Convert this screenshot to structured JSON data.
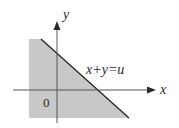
{
  "diagram": {
    "type": "region-plot",
    "axes": {
      "x_label": "x",
      "y_label": "y",
      "origin_label": "0"
    },
    "line_label": "x+y=u",
    "shaded_region": "x + y ≤ u",
    "colors": {
      "shade": "#c8c8c8",
      "line": "#2a2a2a",
      "axis": "#555555",
      "background": "#ffffff"
    }
  }
}
